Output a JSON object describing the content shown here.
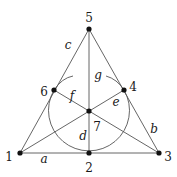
{
  "diagram": {
    "points": [
      {
        "id": "1",
        "label": "1",
        "x": 20,
        "y": 153,
        "lx": 9,
        "ly": 161
      },
      {
        "id": "2",
        "label": "2",
        "x": 89,
        "y": 153,
        "lx": 89,
        "ly": 172
      },
      {
        "id": "3",
        "label": "3",
        "x": 159,
        "y": 153,
        "lx": 168,
        "ly": 161
      },
      {
        "id": "4",
        "label": "4",
        "x": 124,
        "y": 90,
        "lx": 133,
        "ly": 91
      },
      {
        "id": "5",
        "label": "5",
        "x": 89,
        "y": 29,
        "lx": 89,
        "ly": 22
      },
      {
        "id": "6",
        "label": "6",
        "x": 54,
        "y": 90,
        "lx": 44,
        "ly": 96
      },
      {
        "id": "7",
        "label": "7",
        "x": 89,
        "y": 111,
        "lx": 97,
        "ly": 131
      }
    ],
    "lines": [
      {
        "name": "a",
        "label": "a",
        "from": "1",
        "to": "3",
        "lx": 44,
        "ly": 163
      },
      {
        "name": "b",
        "label": "b",
        "from": "3",
        "to": "5",
        "lx": 154,
        "ly": 133
      },
      {
        "name": "c",
        "label": "c",
        "from": "1",
        "to": "5",
        "lx": 68,
        "ly": 49
      },
      {
        "name": "d",
        "label": "d",
        "from": "5",
        "to": "2",
        "lx": 83,
        "ly": 140
      },
      {
        "name": "e",
        "label": "e",
        "from": "1",
        "to": "4",
        "lx": 116,
        "ly": 106
      },
      {
        "name": "f",
        "label": "f",
        "from": "6",
        "to": "3",
        "lx": 72,
        "ly": 100
      },
      {
        "name": "g",
        "label": "g",
        "from": "circle",
        "to": "circle",
        "lx": 98,
        "ly": 79
      }
    ],
    "circle": {
      "cx": 89,
      "cy": 111,
      "r": 42
    },
    "colors": {
      "stroke": "#555555",
      "point": "#111111",
      "text": "#1a1a1a"
    }
  }
}
